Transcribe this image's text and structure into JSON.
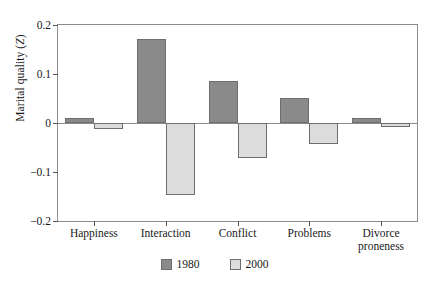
{
  "chart_data": {
    "type": "bar",
    "title": "",
    "subtitle": "",
    "xlabel": "",
    "ylabel": "Marital quality (Z)",
    "ylabel_italic_part": "Z",
    "categories": [
      "Happiness",
      "Interaction",
      "Conflict",
      "Problems",
      "Divorce proneness"
    ],
    "category_lines": [
      [
        "Happiness"
      ],
      [
        "Interaction"
      ],
      [
        "Conflict"
      ],
      [
        "Problems"
      ],
      [
        "Divorce",
        "proneness"
      ]
    ],
    "series": [
      {
        "name": "1980",
        "color": "#8a8a8a",
        "values": [
          0.011,
          0.172,
          0.085,
          0.052,
          0.011
        ]
      },
      {
        "name": "2000",
        "color": "#dcdcdc",
        "values": [
          -0.012,
          -0.146,
          -0.072,
          -0.043,
          -0.008
        ]
      }
    ],
    "ylim": [
      -0.2,
      0.2
    ],
    "yticks": [
      0.2,
      0.1,
      0,
      -0.1,
      -0.2
    ],
    "ytick_labels": [
      "0.2",
      "0.1",
      "0",
      "−0.1",
      "−0.2"
    ],
    "grid": false,
    "legend_position": "bottom-center",
    "zero_line": true,
    "frame_color": "#8c8c8c",
    "bar_edge_color": "#6e6e6e",
    "background_color": "#ffffff"
  },
  "legend": {
    "entries": [
      {
        "label": "1980",
        "color": "#8a8a8a"
      },
      {
        "label": "2000",
        "color": "#dcdcdc"
      }
    ]
  }
}
